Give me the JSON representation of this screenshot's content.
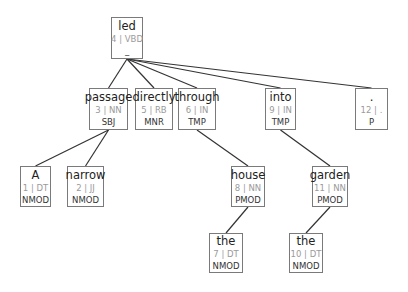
{
  "diagram": {
    "type": "dependency-tree",
    "edge_color": "#333333",
    "border_color": "#7a7a7a",
    "nodes": [
      {
        "id": 4,
        "word": "led",
        "index": "4",
        "pos": "VBD",
        "idx_label": "4 | VBD",
        "rel": "_",
        "head": null,
        "box": [
          111,
          17,
          32,
          42
        ]
      },
      {
        "id": 3,
        "word": "passage",
        "index": "3",
        "pos": "NN",
        "idx_label": "3 | NN",
        "rel": "SBJ",
        "head": 4,
        "box": [
          89,
          88,
          39,
          42
        ]
      },
      {
        "id": 5,
        "word": "directly",
        "index": "5",
        "pos": "RB",
        "idx_label": "5 | RB",
        "rel": "MNR",
        "head": 4,
        "box": [
          135,
          88,
          38,
          42
        ]
      },
      {
        "id": 6,
        "word": "through",
        "index": "6",
        "pos": "IN",
        "idx_label": "6 | IN",
        "rel": "TMP",
        "head": 4,
        "box": [
          178,
          88,
          38,
          42
        ]
      },
      {
        "id": 9,
        "word": "into",
        "index": "9",
        "pos": "IN",
        "idx_label": "9 | IN",
        "rel": "TMP",
        "head": 4,
        "box": [
          265,
          88,
          31,
          42
        ]
      },
      {
        "id": 12,
        "word": ".",
        "index": "12",
        "pos": ".",
        "idx_label": "12 | .",
        "rel": "P",
        "head": 4,
        "box": [
          355,
          88,
          33,
          42
        ]
      },
      {
        "id": 1,
        "word": "A",
        "index": "1",
        "pos": "DT",
        "idx_label": "1 | DT",
        "rel": "NMOD",
        "head": 3,
        "box": [
          20,
          166,
          31,
          41
        ]
      },
      {
        "id": 2,
        "word": "narrow",
        "index": "2",
        "pos": "JJ",
        "idx_label": "2 | JJ",
        "rel": "NMOD",
        "head": 3,
        "box": [
          67,
          166,
          37,
          41
        ]
      },
      {
        "id": 8,
        "word": "house",
        "index": "8",
        "pos": "NN",
        "idx_label": "8 | NN",
        "rel": "PMOD",
        "head": 6,
        "box": [
          231,
          166,
          34,
          41
        ]
      },
      {
        "id": 11,
        "word": "garden",
        "index": "11",
        "pos": "NN",
        "idx_label": "11 | NN",
        "rel": "PMOD",
        "head": 9,
        "box": [
          312,
          166,
          36,
          41
        ]
      },
      {
        "id": 7,
        "word": "the",
        "index": "7",
        "pos": "DT",
        "idx_label": "7 | DT",
        "rel": "NMOD",
        "head": 8,
        "box": [
          209,
          233,
          34,
          40
        ]
      },
      {
        "id": 10,
        "word": "the",
        "index": "10",
        "pos": "DT",
        "idx_label": "10 | DT",
        "rel": "NMOD",
        "head": 11,
        "box": [
          289,
          233,
          34,
          40
        ]
      }
    ]
  },
  "nodes": {
    "led": {
      "word": "led",
      "idx": "4 | VBD",
      "rel": "_"
    },
    "passage": {
      "word": "passage",
      "idx": "3 | NN",
      "rel": "SBJ"
    },
    "directly": {
      "word": "directly",
      "idx": "5 | RB",
      "rel": "MNR"
    },
    "through": {
      "word": "through",
      "idx": "6 | IN",
      "rel": "TMP"
    },
    "into": {
      "word": "into",
      "idx": "9 | IN",
      "rel": "TMP"
    },
    "period": {
      "word": ".",
      "idx": "12 | .",
      "rel": "P"
    },
    "a": {
      "word": "A",
      "idx": "1 | DT",
      "rel": "NMOD"
    },
    "narrow": {
      "word": "narrow",
      "idx": "2 | JJ",
      "rel": "NMOD"
    },
    "house": {
      "word": "house",
      "idx": "8 | NN",
      "rel": "PMOD"
    },
    "garden": {
      "word": "garden",
      "idx": "11 | NN",
      "rel": "PMOD"
    },
    "the7": {
      "word": "the",
      "idx": "7 | DT",
      "rel": "NMOD"
    },
    "the10": {
      "word": "the",
      "idx": "10 | DT",
      "rel": "NMOD"
    }
  }
}
